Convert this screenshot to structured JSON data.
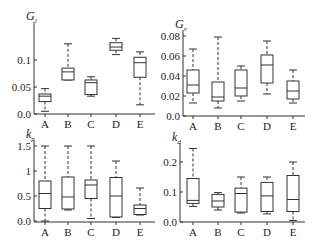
{
  "chart_data": [
    {
      "type": "box",
      "title": "G_l",
      "title_main": "G",
      "title_sub": "l",
      "categories": [
        "A",
        "B",
        "C",
        "D",
        "E"
      ],
      "ylim": [
        0,
        0.13
      ],
      "yticks": [
        {
          "v": 0.0,
          "label": "0.0"
        },
        {
          "v": 0.05,
          "label": "0.05"
        },
        {
          "v": 0.1,
          "label": "0.1"
        }
      ],
      "boxes": [
        {
          "min": 0.005,
          "q1": 0.023,
          "median": 0.033,
          "q3": 0.037,
          "max": 0.047
        },
        {
          "min": 0.063,
          "q1": 0.063,
          "median": 0.078,
          "q3": 0.085,
          "max": 0.13
        },
        {
          "min": 0.033,
          "q1": 0.036,
          "median": 0.058,
          "q3": 0.063,
          "max": 0.069
        },
        {
          "min": 0.11,
          "q1": 0.118,
          "median": 0.124,
          "q3": 0.132,
          "max": 0.14
        },
        {
          "min": 0.017,
          "q1": 0.068,
          "median": 0.095,
          "q3": 0.105,
          "max": 0.115
        }
      ],
      "frame": {
        "x0": 34,
        "x1": 155,
        "ytop": 22,
        "ybot": 114,
        "y0px": 114,
        "yscale": 540
      },
      "cat_x": [
        45,
        68,
        91,
        116,
        140
      ]
    },
    {
      "type": "box",
      "title": "G_v",
      "title_main": "G",
      "title_sub": "v",
      "categories": [
        "A",
        "B",
        "C",
        "D",
        "E"
      ],
      "ylim": [
        0,
        0.08
      ],
      "yticks": [
        {
          "v": 0.0,
          "label": "0.0"
        },
        {
          "v": 0.02,
          "label": "0.02"
        },
        {
          "v": 0.04,
          "label": "0.04"
        },
        {
          "v": 0.06,
          "label": "0.06"
        },
        {
          "v": 0.08,
          "label": "0.08"
        }
      ],
      "boxes": [
        {
          "min": 0.013,
          "q1": 0.023,
          "median": 0.031,
          "q3": 0.046,
          "max": 0.067
        },
        {
          "min": 0.008,
          "q1": 0.015,
          "median": 0.019,
          "q3": 0.034,
          "max": 0.079
        },
        {
          "min": 0.015,
          "q1": 0.02,
          "median": 0.028,
          "q3": 0.046,
          "max": 0.05
        },
        {
          "min": 0.022,
          "q1": 0.033,
          "median": 0.051,
          "q3": 0.061,
          "max": 0.075
        },
        {
          "min": 0.013,
          "q1": 0.017,
          "median": 0.025,
          "q3": 0.035,
          "max": 0.046
        }
      ],
      "frame": {
        "x0": 183,
        "x1": 305,
        "ytop": 30,
        "ybot": 116,
        "y0px": 116,
        "yscale": 1000
      },
      "cat_x": [
        193,
        218,
        241,
        267,
        293
      ]
    },
    {
      "type": "box",
      "title": "k_p",
      "title_main": "k",
      "title_sub": "p",
      "categories": [
        "A",
        "B",
        "C",
        "D",
        "E"
      ],
      "ylim": [
        0,
        1.5
      ],
      "yticks": [
        {
          "v": 0.0,
          "label": "0.0"
        },
        {
          "v": 0.5,
          "label": "0.5"
        },
        {
          "v": 1,
          "label": "1"
        },
        {
          "v": 1.5,
          "label": "1.5"
        }
      ],
      "boxes": [
        {
          "min": 0.0,
          "q1": 0.25,
          "median": 0.55,
          "q3": 0.8,
          "max": 1.5
        },
        {
          "min": 0.22,
          "q1": 0.24,
          "median": 0.48,
          "q3": 0.88,
          "max": 1.5
        },
        {
          "min": 0.05,
          "q1": 0.45,
          "median": 0.72,
          "q3": 0.82,
          "max": 1.5
        },
        {
          "min": 0.07,
          "q1": 0.08,
          "median": 0.5,
          "q3": 0.87,
          "max": 1.2
        },
        {
          "min": 0.12,
          "q1": 0.13,
          "median": 0.25,
          "q3": 0.32,
          "max": 0.66
        }
      ],
      "frame": {
        "x0": 34,
        "x1": 155,
        "ytop": 140,
        "ybot": 222,
        "y0px": 221,
        "yscale": 50
      },
      "cat_x": [
        45,
        68,
        91,
        116,
        140
      ]
    },
    {
      "type": "box",
      "title": "k_d",
      "title_main": "k",
      "title_sub": "d",
      "categories": [
        "A",
        "B",
        "C",
        "D",
        "E"
      ],
      "ylim": [
        0,
        0.25
      ],
      "yticks": [
        {
          "v": 0.0,
          "label": "0.0"
        },
        {
          "v": 0.1,
          "label": "0.1"
        },
        {
          "v": 0.2,
          "label": "0.2"
        }
      ],
      "boxes": [
        {
          "min": 0.052,
          "q1": 0.062,
          "median": 0.072,
          "q3": 0.145,
          "max": 0.245
        },
        {
          "min": 0.04,
          "q1": 0.05,
          "median": 0.07,
          "q3": 0.092,
          "max": 0.098
        },
        {
          "min": 0.03,
          "q1": 0.033,
          "median": 0.095,
          "q3": 0.113,
          "max": 0.15
        },
        {
          "min": 0.027,
          "q1": 0.035,
          "median": 0.087,
          "q3": 0.132,
          "max": 0.15
        },
        {
          "min": 0.005,
          "q1": 0.035,
          "median": 0.075,
          "q3": 0.155,
          "max": 0.2
        }
      ],
      "frame": {
        "x0": 180,
        "x1": 305,
        "ytop": 143,
        "ybot": 222,
        "y0px": 222,
        "yscale": 300
      },
      "cat_x": [
        193,
        218,
        241,
        267,
        293
      ]
    }
  ]
}
